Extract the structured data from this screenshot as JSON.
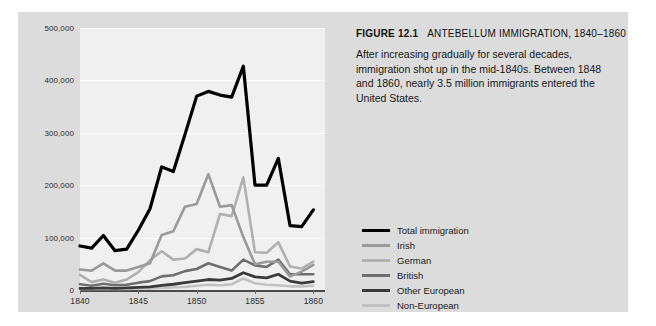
{
  "figure": {
    "label": "FIGURE 12.1",
    "title": "ANTEBELLUM IMMIGRATION, 1840–1860",
    "caption": "After increasing gradually for several decades, immigration shot up in the mid-1840s. Between 1848 and 1860, nearly 3.5 million immigrants entered the United States."
  },
  "panel": {
    "background_color": "#dcdcdc",
    "plot_background_color": "#f0f0f0",
    "gridline_color": "#ffffff",
    "bleed_text": "Reform Movement"
  },
  "legend": {
    "position": "right-below-caption",
    "items": [
      {
        "label": "Total immigration",
        "color": "#000000",
        "thickness": 3.2
      },
      {
        "label": "Irish",
        "color": "#9a9a9a",
        "thickness": 2.6
      },
      {
        "label": "German",
        "color": "#b0b0b0",
        "thickness": 2.6
      },
      {
        "label": "British",
        "color": "#6e6e6e",
        "thickness": 2.6
      },
      {
        "label": "Other European",
        "color": "#3a3a3a",
        "thickness": 2.8
      },
      {
        "label": "Non-European",
        "color": "#c2c2c2",
        "thickness": 2.6
      }
    ]
  },
  "chart_data": {
    "type": "line",
    "title": "ANTEBELLUM IMMIGRATION, 1840–1860",
    "xlabel": "",
    "ylabel": "",
    "xlim": [
      1840,
      1861
    ],
    "ylim": [
      0,
      500000
    ],
    "grid": true,
    "x": [
      1840,
      1841,
      1842,
      1843,
      1844,
      1845,
      1846,
      1847,
      1848,
      1849,
      1850,
      1851,
      1852,
      1853,
      1854,
      1855,
      1856,
      1857,
      1858,
      1859,
      1860
    ],
    "xticks": [
      1840,
      1845,
      1850,
      1855,
      1860
    ],
    "xtick_labels": [
      "1840",
      "1845",
      "1850",
      "1855",
      "1860"
    ],
    "yticks": [
      0,
      100000,
      200000,
      300000,
      400000,
      500000
    ],
    "ytick_labels": [
      "0",
      "100,000",
      "200,000",
      "300,000",
      "400,000",
      "500,000"
    ],
    "series": [
      {
        "name": "Total immigration",
        "color": "#000000",
        "values": [
          84000,
          80000,
          104000,
          75000,
          78000,
          114000,
          155000,
          235000,
          226000,
          297000,
          370000,
          379000,
          372000,
          368000,
          427000,
          200000,
          200000,
          251000,
          123000,
          121000,
          153000
        ]
      },
      {
        "name": "Irish",
        "color": "#9a9a9a",
        "values": [
          39000,
          37000,
          51000,
          37000,
          37000,
          44000,
          51000,
          105000,
          112000,
          159000,
          164000,
          221000,
          159000,
          162000,
          101000,
          49000,
          54000,
          54000,
          26000,
          35000,
          48000
        ]
      },
      {
        "name": "German",
        "color": "#b0b0b0",
        "values": [
          29000,
          15000,
          20000,
          14000,
          20000,
          34000,
          57000,
          74000,
          58000,
          60000,
          78000,
          72000,
          145000,
          141000,
          215000,
          72000,
          71000,
          91000,
          45000,
          41000,
          54000
        ]
      },
      {
        "name": "British",
        "color": "#6e6e6e",
        "values": [
          11000,
          8000,
          12000,
          9000,
          10000,
          14000,
          17000,
          26000,
          28000,
          36000,
          40000,
          51000,
          44000,
          37000,
          58000,
          47000,
          44000,
          58000,
          30000,
          30000,
          30000
        ]
      },
      {
        "name": "Other European",
        "color": "#3a3a3a",
        "values": [
          3000,
          3000,
          4000,
          3000,
          4000,
          5000,
          6000,
          9000,
          11000,
          14000,
          17000,
          20000,
          19000,
          22000,
          33000,
          25000,
          23000,
          30000,
          17000,
          13000,
          16000
        ]
      },
      {
        "name": "Non-European",
        "color": "#c2c2c2",
        "values": [
          2000,
          2000,
          2000,
          2000,
          2000,
          3000,
          3000,
          4000,
          5000,
          6000,
          8000,
          10000,
          9000,
          11000,
          22000,
          13000,
          10000,
          9000,
          7000,
          7000,
          8000
        ]
      }
    ]
  }
}
